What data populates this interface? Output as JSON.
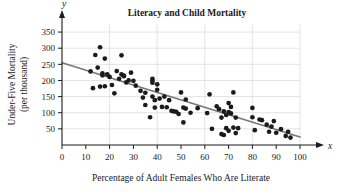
{
  "chart_data": {
    "type": "scatter",
    "title": "Literacy and Child Mortality",
    "xlabel": "Percentage of Adult Females Who Are Literate",
    "ylabel_line1": "Under-Five Mortality",
    "ylabel_line2": "(per thousand)",
    "x_axis_variable": "x",
    "y_axis_variable": "y",
    "xlim": [
      0,
      100
    ],
    "ylim": [
      0,
      375
    ],
    "xticks": [
      0,
      10,
      20,
      30,
      40,
      50,
      60,
      70,
      80,
      90,
      100
    ],
    "yticks": [
      50,
      100,
      150,
      200,
      250,
      300,
      350
    ],
    "grid": true,
    "grid_x": [
      20,
      40,
      60,
      80,
      100
    ],
    "grid_y": [
      50,
      100,
      150,
      200,
      250,
      300,
      350
    ],
    "legend": null,
    "colors": {
      "point": "#1b1b1b",
      "trend_line": "#777777",
      "grid": "#d8d8d8",
      "axis": "#1a1a1a",
      "background": "#ffffff"
    },
    "trend_line": {
      "type": "linear",
      "x_start": 0,
      "y_start": 255,
      "x_end": 100,
      "y_end": 25,
      "slope": -2.3,
      "intercept": 255
    },
    "points": [
      [
        12,
        228
      ],
      [
        13,
        176
      ],
      [
        14,
        279
      ],
      [
        15,
        240
      ],
      [
        16,
        303
      ],
      [
        16,
        181
      ],
      [
        17,
        222
      ],
      [
        17,
        216
      ],
      [
        18,
        268
      ],
      [
        18,
        182
      ],
      [
        19,
        219
      ],
      [
        20,
        211
      ],
      [
        21,
        186
      ],
      [
        22,
        160
      ],
      [
        23,
        229
      ],
      [
        24,
        205
      ],
      [
        25,
        278
      ],
      [
        25,
        219
      ],
      [
        26,
        215
      ],
      [
        26,
        213
      ],
      [
        27,
        194
      ],
      [
        28,
        200
      ],
      [
        29,
        224
      ],
      [
        30,
        199
      ],
      [
        31,
        184
      ],
      [
        33,
        168
      ],
      [
        34,
        147
      ],
      [
        35,
        124
      ],
      [
        35,
        162
      ],
      [
        37,
        86
      ],
      [
        38,
        205
      ],
      [
        38,
        199
      ],
      [
        38,
        193
      ],
      [
        38,
        150
      ],
      [
        39,
        139
      ],
      [
        39,
        116
      ],
      [
        40,
        188
      ],
      [
        40,
        171
      ],
      [
        41,
        144
      ],
      [
        42,
        118
      ],
      [
        43,
        150
      ],
      [
        44,
        117
      ],
      [
        45,
        139
      ],
      [
        46,
        106
      ],
      [
        47,
        104
      ],
      [
        48,
        103
      ],
      [
        49,
        96
      ],
      [
        50,
        163
      ],
      [
        51,
        116
      ],
      [
        51,
        70
      ],
      [
        52,
        141
      ],
      [
        52,
        113
      ],
      [
        54,
        100
      ],
      [
        57,
        114
      ],
      [
        61,
        99
      ],
      [
        62,
        157
      ],
      [
        63,
        50
      ],
      [
        65,
        120
      ],
      [
        66,
        111
      ],
      [
        67,
        85
      ],
      [
        67,
        34
      ],
      [
        68,
        31
      ],
      [
        68,
        104
      ],
      [
        69,
        93
      ],
      [
        69,
        52
      ],
      [
        70,
        130
      ],
      [
        70,
        102
      ],
      [
        70,
        44
      ],
      [
        71,
        118
      ],
      [
        71,
        98
      ],
      [
        72,
        163
      ],
      [
        72,
        54
      ],
      [
        73,
        37
      ],
      [
        73,
        85
      ],
      [
        74,
        52
      ],
      [
        80,
        115
      ],
      [
        80,
        86
      ],
      [
        81,
        46
      ],
      [
        83,
        79
      ],
      [
        84,
        77
      ],
      [
        86,
        63
      ],
      [
        87,
        41
      ],
      [
        88,
        57
      ],
      [
        89,
        74
      ],
      [
        90,
        38
      ],
      [
        92,
        49
      ],
      [
        94,
        28
      ],
      [
        95,
        41
      ],
      [
        96,
        23
      ]
    ]
  }
}
